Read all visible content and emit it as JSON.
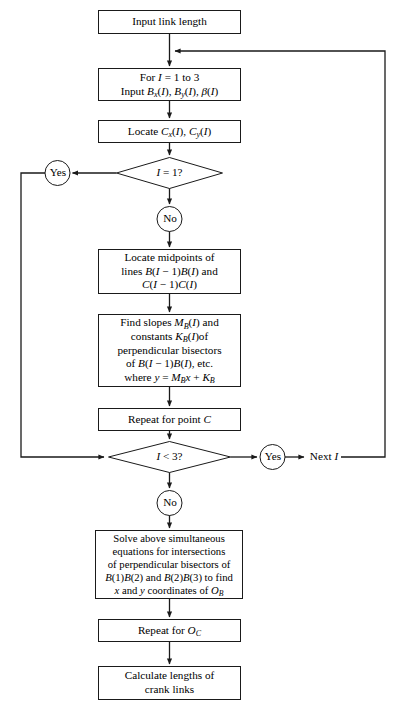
{
  "diagram": {
    "type": "flowchart",
    "stroke_color": "#1a1a1a",
    "fill_color": "#ffffff",
    "background_color": "#ffffff"
  },
  "nodes": {
    "input_link_length": {
      "shape": "process",
      "lines": [
        "Input link length"
      ]
    },
    "for_loop": {
      "shape": "process",
      "lines": [
        "For I = 1 to 3",
        "Input Bx(I), By(I), β(I)"
      ]
    },
    "locate_c": {
      "shape": "process",
      "lines": [
        "Locate Cx(I), Cy(I)"
      ]
    },
    "decision_i_eq_1": {
      "shape": "decision",
      "lines": [
        "I = 1?"
      ]
    },
    "locate_midpoints": {
      "shape": "process",
      "lines": [
        "Locate midpoints of",
        "lines B(I − 1)B(I) and",
        "C(I − 1)C(I)"
      ]
    },
    "find_slopes": {
      "shape": "process",
      "lines": [
        "Find slopes MB(I) and",
        "constants KB(I)of",
        "perpendicular bisectors",
        "of B(I − 1)B(I), etc.",
        "where y = MBx + KB"
      ]
    },
    "repeat_point_c": {
      "shape": "process",
      "lines": [
        "Repeat for point C"
      ]
    },
    "decision_i_lt_3": {
      "shape": "decision",
      "lines": [
        "I < 3?"
      ]
    },
    "solve_simultaneous": {
      "shape": "process",
      "lines": [
        "Solve above simultaneous",
        "equations for intersections",
        "of perpendicular bisectors of",
        "B(1)B(2) and B(2)B(3) to find",
        "x and y coordinates of OB"
      ]
    },
    "repeat_oc": {
      "shape": "process",
      "lines": [
        "Repeat for OC"
      ]
    },
    "calculate_lengths": {
      "shape": "process",
      "lines": [
        "Calculate lengths of",
        "crank links"
      ]
    }
  },
  "connector_labels": {
    "yes_top": "Yes",
    "no_top": "No",
    "yes_bottom": "Yes",
    "no_bottom": "No",
    "next_i": "Next I"
  }
}
